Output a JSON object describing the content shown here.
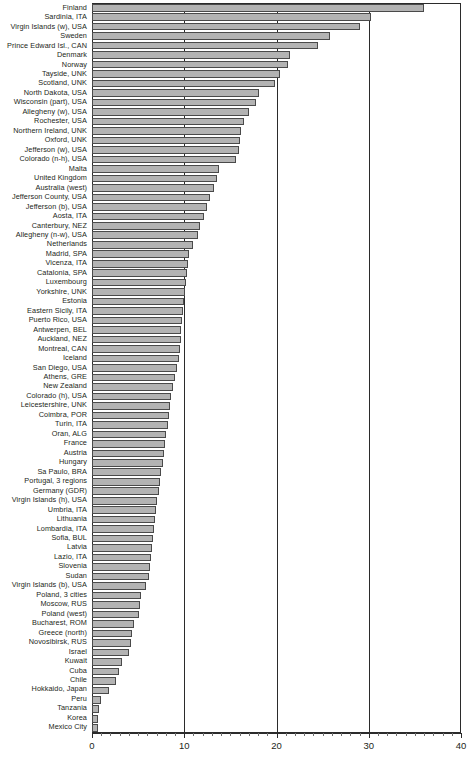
{
  "chart_data": {
    "type": "bar",
    "orientation": "horizontal",
    "title": "",
    "subtitle": "",
    "xlabel": "",
    "ylabel": "",
    "xlim": [
      0,
      40
    ],
    "xticks": [
      0,
      10,
      20,
      30,
      40
    ],
    "xtick_labels": [
      "0",
      "10",
      "20",
      "30",
      "40"
    ],
    "minor_tick_step": 1,
    "grid": true,
    "grid_axis": "x",
    "legend": false,
    "bar_fill_color": "#b3b3b3",
    "bar_edge_color": "#4a4a4a",
    "axis_color": "#2b2b2b",
    "text_color": "#231f20",
    "categories": [
      "Finland",
      "Sardinia, ITA",
      "Virgin Islands (w), USA",
      "Sweden",
      "Prince Edward Isl., CAN",
      "Denmark",
      "Norway",
      "Tayside, UNK",
      "Scotland, UNK",
      "North Dakota, USA",
      "Wisconsin (part), USA",
      "Allegheny (w), USA",
      "Rochester, USA",
      "Northern Ireland, UNK",
      "Oxford, UNK",
      "Jefferson (w), USA",
      "Colorado (n-h), USA",
      "Malta",
      "United Kingdom",
      "Australia (west)",
      "Jefferson County, USA",
      "Jefferson (b), USA",
      "Aosta, ITA",
      "Canterbury, NEZ",
      "Allegheny (n-w), USA",
      "Netherlands",
      "Madrid, SPA",
      "Vicenza, ITA",
      "Catalonia, SPA",
      "Luxembourg",
      "Yorkshire, UNK",
      "Estonia",
      "Eastern Sicily, ITA",
      "Puerto Rico, USA",
      "Antwerpen, BEL",
      "Auckland, NEZ",
      "Montreal, CAN",
      "Iceland",
      "San Diego, USA",
      "Athens, GRE",
      "New Zealand",
      "Colorado (h), USA",
      "Leicestershire, UNK",
      "Coimbra, POR",
      "Turin, ITA",
      "Oran, ALG",
      "France",
      "Austria",
      "Hungary",
      "Sa Paulo, BRA",
      "Portugal, 3 regions",
      "Germany (GDR)",
      "Virgin Islands (h), USA",
      "Umbria, ITA",
      "Lithuania",
      "Lombardia, ITA",
      "Sofia, BUL",
      "Latvia",
      "Lazio, ITA",
      "Slovenia",
      "Sudan",
      "Virgin Islands (b), USA",
      "Poland, 3 cities",
      "Moscow, RUS",
      "Poland (west)",
      "Bucharest, ROM",
      "Greece (north)",
      "Novosibirsk, RUS",
      "Israel",
      "Kuwait",
      "Cuba",
      "Chile",
      "Hokkaido, Japan",
      "Peru",
      "Tanzania",
      "Korea",
      "Mexico City"
    ],
    "values": [
      36.0,
      30.2,
      29.0,
      25.8,
      24.5,
      21.5,
      21.2,
      20.4,
      19.8,
      18.1,
      17.8,
      17.0,
      16.5,
      16.2,
      16.0,
      15.9,
      15.6,
      13.8,
      13.5,
      13.2,
      12.8,
      12.5,
      12.1,
      11.7,
      11.5,
      10.9,
      10.5,
      10.4,
      10.3,
      10.2,
      10.1,
      10.0,
      9.9,
      9.8,
      9.7,
      9.6,
      9.5,
      9.4,
      9.2,
      9.0,
      8.8,
      8.6,
      8.5,
      8.4,
      8.2,
      8.0,
      7.9,
      7.8,
      7.7,
      7.5,
      7.4,
      7.3,
      7.0,
      6.9,
      6.8,
      6.7,
      6.6,
      6.5,
      6.4,
      6.3,
      6.2,
      5.8,
      5.3,
      5.2,
      5.1,
      4.5,
      4.3,
      4.2,
      4.0,
      3.2,
      2.9,
      2.6,
      1.8,
      1.0,
      0.8,
      0.7,
      0.6
    ]
  }
}
